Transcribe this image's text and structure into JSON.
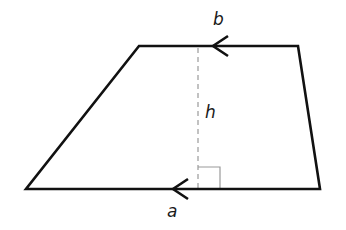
{
  "diagram": {
    "shape": "trapezoid",
    "labels": {
      "top_base": "b",
      "bottom_base": "a",
      "height": "h"
    },
    "vertices": {
      "top_left": [
        139,
        46
      ],
      "top_right": [
        298,
        46
      ],
      "bottom_right": [
        320,
        189
      ],
      "bottom_left": [
        26,
        189
      ]
    },
    "height_line": {
      "x": 198,
      "y_top": 46,
      "y_bottom": 189,
      "style": "dashed"
    },
    "right_angle_marker": {
      "x": 198,
      "y": 167,
      "size": 22
    },
    "arrows": [
      {
        "edge": "top",
        "tip": [
          213,
          46
        ],
        "direction": "left"
      },
      {
        "edge": "bottom",
        "tip": [
          173,
          189
        ],
        "direction": "left"
      }
    ],
    "colors": {
      "outline": "#111111",
      "dashed_line": "#9a9a9a",
      "right_angle": "#9a9a9a",
      "label": "#1a1a1a",
      "background": "#ffffff"
    }
  }
}
